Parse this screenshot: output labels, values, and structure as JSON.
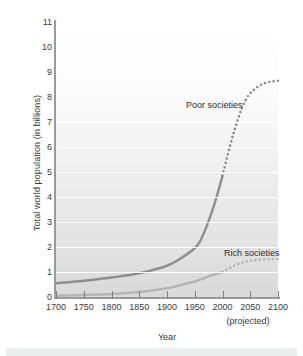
{
  "chart_data": {
    "type": "line",
    "title": "",
    "xlabel": "Year",
    "ylabel": "Total world population (in billions)",
    "xlim": [
      1700,
      2100
    ],
    "ylim": [
      0,
      11
    ],
    "xticks": [
      1700,
      1750,
      1800,
      1850,
      1900,
      1950,
      2000,
      2050,
      2100
    ],
    "yticks": [
      0,
      1,
      2,
      3,
      4,
      5,
      6,
      7,
      8,
      9,
      10,
      11
    ],
    "grid": true,
    "legend_position": "inline-annotations",
    "projection_note": "(projected)",
    "projection_start_year": 2000,
    "series": [
      {
        "name": "Poor societies",
        "color": "#8e8e8e",
        "label_x": 1950,
        "label_y": 7.3,
        "x": [
          1700,
          1750,
          1800,
          1850,
          1900,
          1925,
          1950,
          1960,
          1970,
          1980,
          1990,
          2000,
          2010,
          2020,
          2030,
          2040,
          2050,
          2060,
          2070,
          2080,
          2090,
          2100
        ],
        "values": [
          0.55,
          0.65,
          0.78,
          0.95,
          1.25,
          1.55,
          1.95,
          2.25,
          2.75,
          3.35,
          4.05,
          4.85,
          5.75,
          6.55,
          7.25,
          7.8,
          8.15,
          8.35,
          8.5,
          8.58,
          8.62,
          8.65
        ]
      },
      {
        "name": "Rich societies",
        "color": "#b5b5b5",
        "label_x": 2035,
        "label_y": 1.95,
        "x": [
          1700,
          1750,
          1800,
          1850,
          1900,
          1925,
          1950,
          1960,
          1970,
          1980,
          1990,
          2000,
          2010,
          2020,
          2030,
          2040,
          2050,
          2060,
          2070,
          2080,
          2090,
          2100
        ],
        "values": [
          0.05,
          0.08,
          0.12,
          0.2,
          0.35,
          0.48,
          0.62,
          0.7,
          0.78,
          0.86,
          0.93,
          1.0,
          1.12,
          1.24,
          1.33,
          1.4,
          1.45,
          1.48,
          1.5,
          1.51,
          1.52,
          1.52
        ]
      }
    ]
  },
  "axes": {
    "ylabel": "Total world population (in billions)",
    "xlabel": "Year",
    "projected_note": "(projected)",
    "ytick_labels": [
      "11",
      "10",
      "9",
      "8",
      "7",
      "6",
      "5",
      "4",
      "3",
      "2",
      "1",
      "0"
    ],
    "xtick_labels": [
      "1700",
      "1750",
      "1800",
      "1850",
      "1900",
      "1950",
      "2000",
      "2050",
      "2100"
    ]
  },
  "annotations": {
    "poor": "Poor societies",
    "rich": "Rich societies"
  },
  "colors": {
    "poor_series": "#8e8e8e",
    "rich_series": "#b5b5b5",
    "axis": "#9a9a9a",
    "text": "#3a3a3a",
    "gridline": "#ffffff"
  }
}
